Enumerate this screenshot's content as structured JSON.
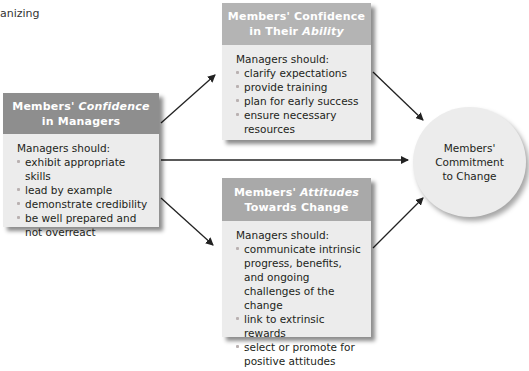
{
  "corner_text": "anizing",
  "boxes": {
    "ability": {
      "title_line1": "Members' Confidence",
      "title_line2_prefix": "in Their ",
      "title_line2_italic": "Ability",
      "intro": "Managers should:",
      "items": [
        "clarify expectations",
        "provide training",
        "plan for early success",
        "ensure necessary resources"
      ]
    },
    "managers": {
      "title_line1_prefix": "Members' ",
      "title_line1_italic": "Confidence",
      "title_line2": "in Managers",
      "intro": "Managers should:",
      "items": [
        "exhibit appropriate skills",
        "lead by example",
        "demonstrate credibility",
        "be well prepared and not overreact"
      ]
    },
    "attitudes": {
      "title_line1_prefix": "Members' ",
      "title_line1_italic": "Attitudes",
      "title_line2": "Towards Change",
      "intro": "Managers should:",
      "items": [
        "communicate intrinsic progress, benefits, and ongoing challenges of the change",
        "link to extrinsic rewards",
        "select or promote for positive attitudes"
      ]
    }
  },
  "outcome": {
    "line1": "Members'",
    "line2": "Commitment",
    "line3": "to Change"
  },
  "colors": {
    "header_ability": "#b4b4b4",
    "header_managers": "#8e8e8e",
    "header_attitudes": "#a9a9a9",
    "box_body": "#ececec",
    "arrow": "#222222"
  }
}
